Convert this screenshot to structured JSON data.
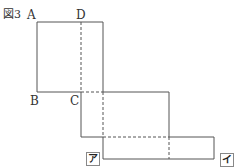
{
  "figure": {
    "title": "図3",
    "points": {
      "A": "A",
      "B": "B",
      "C": "C",
      "D": "D"
    },
    "markers": {
      "a": "ア",
      "i": "イ"
    }
  }
}
